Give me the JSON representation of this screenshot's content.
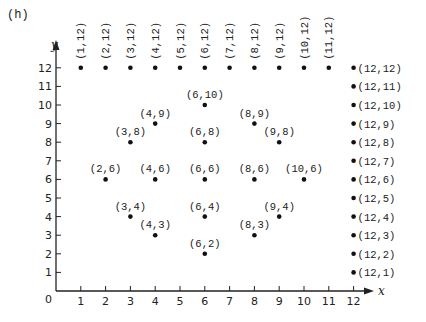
{
  "panel_label": "(h)",
  "axes": {
    "x_label": "x",
    "y_label": "y",
    "origin_label": "0",
    "x_ticks": [
      "1",
      "2",
      "3",
      "4",
      "5",
      "6",
      "7",
      "8",
      "9",
      "10",
      "11",
      "12"
    ],
    "y_ticks": [
      "1",
      "2",
      "3",
      "4",
      "5",
      "6",
      "7",
      "8",
      "9",
      "10",
      "11",
      "12"
    ]
  },
  "chart_data": {
    "type": "scatter",
    "title": "(h)",
    "xlabel": "x",
    "ylabel": "y",
    "xlim": [
      0,
      12
    ],
    "ylim": [
      0,
      12
    ],
    "grid": false,
    "legend": null,
    "series": [
      {
        "name": "top-row",
        "label_orientation": "vertical",
        "points": [
          {
            "x": 1,
            "y": 12,
            "label": "(1,12)"
          },
          {
            "x": 2,
            "y": 12,
            "label": "(2,12)"
          },
          {
            "x": 3,
            "y": 12,
            "label": "(3,12)"
          },
          {
            "x": 4,
            "y": 12,
            "label": "(4,12)"
          },
          {
            "x": 5,
            "y": 12,
            "label": "(5,12)"
          },
          {
            "x": 6,
            "y": 12,
            "label": "(6,12)"
          },
          {
            "x": 7,
            "y": 12,
            "label": "(7,12)"
          },
          {
            "x": 8,
            "y": 12,
            "label": "(8,12)"
          },
          {
            "x": 9,
            "y": 12,
            "label": "(9,12)"
          },
          {
            "x": 10,
            "y": 12,
            "label": "(10,12)"
          },
          {
            "x": 11,
            "y": 12,
            "label": "(11,12)"
          }
        ]
      },
      {
        "name": "right-column",
        "label_orientation": "right",
        "points": [
          {
            "x": 12,
            "y": 12,
            "label": "(12,12)"
          },
          {
            "x": 12,
            "y": 11,
            "label": "(12,11)"
          },
          {
            "x": 12,
            "y": 10,
            "label": "(12,10)"
          },
          {
            "x": 12,
            "y": 9,
            "label": "(12,9)"
          },
          {
            "x": 12,
            "y": 8,
            "label": "(12,8)"
          },
          {
            "x": 12,
            "y": 7,
            "label": "(12,7)"
          },
          {
            "x": 12,
            "y": 6,
            "label": "(12,6)"
          },
          {
            "x": 12,
            "y": 5,
            "label": "(12,5)"
          },
          {
            "x": 12,
            "y": 4,
            "label": "(12,4)"
          },
          {
            "x": 12,
            "y": 3,
            "label": "(12,3)"
          },
          {
            "x": 12,
            "y": 2,
            "label": "(12,2)"
          },
          {
            "x": 12,
            "y": 1,
            "label": "(12,1)"
          }
        ]
      },
      {
        "name": "inner-pattern",
        "label_orientation": "above",
        "points": [
          {
            "x": 6,
            "y": 10,
            "label": "(6,10)"
          },
          {
            "x": 4,
            "y": 9,
            "label": "(4,9)"
          },
          {
            "x": 8,
            "y": 9,
            "label": "(8,9)"
          },
          {
            "x": 3,
            "y": 8,
            "label": "(3,8)"
          },
          {
            "x": 6,
            "y": 8,
            "label": "(6,8)"
          },
          {
            "x": 9,
            "y": 8,
            "label": "(9,8)"
          },
          {
            "x": 2,
            "y": 6,
            "label": "(2,6)"
          },
          {
            "x": 4,
            "y": 6,
            "label": "(4,6)"
          },
          {
            "x": 6,
            "y": 6,
            "label": "(6,6)"
          },
          {
            "x": 8,
            "y": 6,
            "label": "(8,6)"
          },
          {
            "x": 10,
            "y": 6,
            "label": "(10,6)"
          },
          {
            "x": 3,
            "y": 4,
            "label": "(3,4)"
          },
          {
            "x": 6,
            "y": 4,
            "label": "(6,4)"
          },
          {
            "x": 9,
            "y": 4,
            "label": "(9,4)"
          },
          {
            "x": 4,
            "y": 3,
            "label": "(4,3)"
          },
          {
            "x": 8,
            "y": 3,
            "label": "(8,3)"
          },
          {
            "x": 6,
            "y": 2,
            "label": "(6,2)"
          }
        ]
      }
    ]
  }
}
